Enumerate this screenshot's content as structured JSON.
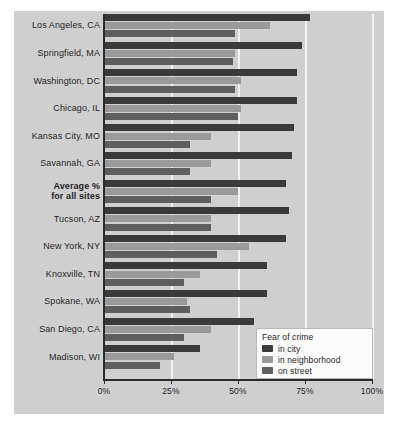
{
  "chart_data": {
    "type": "bar",
    "orientation": "horizontal",
    "title": "",
    "xlabel": "",
    "ylabel": "",
    "xlim": [
      0,
      100
    ],
    "xticks": [
      0,
      25,
      50,
      75,
      100
    ],
    "xticklabels": [
      "0%",
      "25%",
      "50%",
      "75%",
      "100%"
    ],
    "grid": true,
    "grid_axis": "x",
    "legend_position": "lower-right",
    "legend_title": "Fear of crime",
    "categories": [
      "Los Angeles, CA",
      "Springfield, MA",
      "Washington, DC",
      "Chicago, IL",
      "Kansas City, MO",
      "Savannah, GA",
      "Average %\nfor all sites",
      "Tucson, AZ",
      "New York, NY",
      "Knoxville, TN",
      "Spokane, WA",
      "San Diego, CA",
      "Madison, WI"
    ],
    "series": [
      {
        "name": "in city",
        "color": "#3a3a3a",
        "values": [
          77,
          74,
          72,
          72,
          71,
          70,
          68,
          69,
          68,
          61,
          61,
          56,
          36
        ]
      },
      {
        "name": "in neighborhood",
        "color": "#9a9a9a",
        "values": [
          62,
          49,
          51,
          51,
          40,
          40,
          50,
          40,
          54,
          36,
          31,
          40,
          26
        ]
      },
      {
        "name": "on street",
        "color": "#5e5e5e",
        "values": [
          49,
          48,
          49,
          50,
          32,
          32,
          40,
          40,
          42,
          30,
          32,
          30,
          21
        ]
      }
    ]
  },
  "axis": {
    "ticks": [
      {
        "label": "0%",
        "value": 0
      },
      {
        "label": "25%",
        "value": 25
      },
      {
        "label": "50%",
        "value": 50
      },
      {
        "label": "75%",
        "value": 75
      },
      {
        "label": "100%",
        "value": 100
      }
    ]
  },
  "legend": {
    "title": "Fear of crime",
    "entries": [
      {
        "label": "in city",
        "color": "#3a3a3a"
      },
      {
        "label": "in neighborhood",
        "color": "#9a9a9a"
      },
      {
        "label": "on street",
        "color": "#5e5e5e"
      }
    ]
  },
  "colors": {
    "plate_background": "#cfcfcf",
    "page_background": "#ffffff",
    "axis": "#2b2b2b",
    "gridline": "#f2f2f2",
    "legend_background": "#fbfbfb",
    "legend_border": "#b9b9b9",
    "text": "#1f1f1f"
  },
  "emphasized_category_index": 6
}
